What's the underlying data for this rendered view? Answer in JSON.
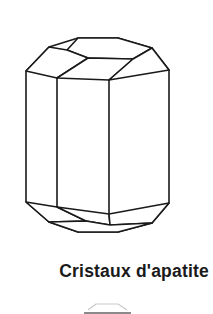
{
  "figure": {
    "caption": "Cristaux d'apatite",
    "illustration": {
      "name": "apatite-crystal",
      "description": "Line drawing of a hexagonal apatite crystal prism with beveled top and bottom terminations",
      "stroke_color": "#1a1a1a",
      "fill_color": "#ffffff",
      "stroke_width": 1.6
    },
    "next_figure_fragment": {
      "name": "cropped-next-illustration",
      "stroke_color": "#bfbfbf"
    }
  },
  "colors": {
    "ink": "#1a1a1a",
    "paper": "#ffffff",
    "faint": "#bfbfbf"
  }
}
